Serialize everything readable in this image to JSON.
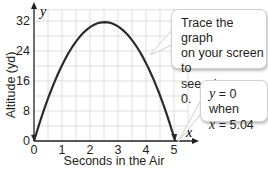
{
  "chart_data": {
    "type": "line",
    "title": "",
    "xlabel": "Seconds in the Air",
    "ylabel": "Altitude (yd)",
    "x_axis_name": "x",
    "y_axis_name": "y",
    "xlim": [
      0,
      5.5
    ],
    "ylim": [
      0,
      34
    ],
    "x_ticks": [
      0,
      1,
      2,
      3,
      4,
      5
    ],
    "y_ticks": [
      0,
      8,
      16,
      24,
      32
    ],
    "grid": true,
    "grid_x_step": 0.5,
    "grid_y_step": 4,
    "series": [
      {
        "name": "altitude",
        "x": [
          0,
          0.5,
          1.0,
          1.5,
          2.0,
          2.52,
          3.0,
          3.5,
          4.0,
          4.5,
          5.04
        ],
        "y": [
          0,
          11.3,
          20.2,
          26.5,
          30.3,
          31.7,
          30.5,
          26.9,
          20.8,
          12.1,
          0
        ]
      }
    ],
    "annotations": [
      "Trace the graph on your screen to see when y = 0.",
      "y = 0 when x = 5.04"
    ]
  },
  "axes": {
    "xlabel": "Seconds in the Air",
    "ylabel": "Altitude (yd)",
    "x_name": "x",
    "y_name": "y",
    "x_tick_labels": [
      "0",
      "1",
      "2",
      "3",
      "4",
      "5"
    ],
    "y_tick_labels": [
      "0",
      "8",
      "16",
      "24",
      "32"
    ]
  },
  "callouts": {
    "trace": {
      "line1": "Trace the graph",
      "line2": "on your screen to",
      "line3_prefix": "see when ",
      "line3_var": "y",
      "line3_suffix": " = 0."
    },
    "result": {
      "line1_var": "y",
      "line1_suffix": " = 0 when",
      "line2_var": "x",
      "line2_suffix": " = 5.04"
    }
  },
  "colors": {
    "curve": "#2b2b2b",
    "grid": "#d6d6d6",
    "axis": "#231f20",
    "callout_border": "#cfcfcf"
  }
}
